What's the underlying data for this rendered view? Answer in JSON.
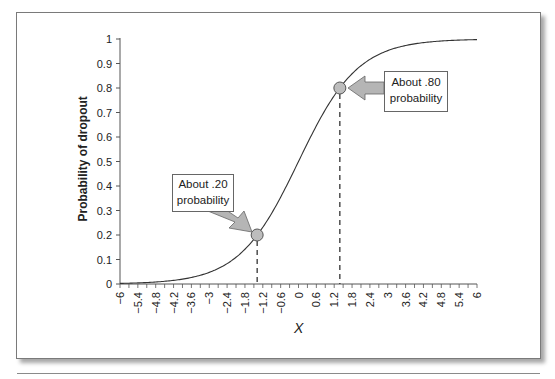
{
  "chart_data": {
    "type": "line",
    "title": "",
    "xlabel": "X",
    "ylabel": "Probability of dropout",
    "xlim": [
      -6,
      6
    ],
    "ylim": [
      0,
      1
    ],
    "grid": false,
    "legend": null,
    "x_ticks": [
      "-6",
      "-5.4",
      "-4.8",
      "-4.2",
      "-3.6",
      "-3",
      "-2.4",
      "-1.8",
      "-1.2",
      "-0.6",
      "0",
      "0.6",
      "1.2",
      "1.8",
      "2.4",
      "3",
      "3.6",
      "4.2",
      "4.8",
      "5.4",
      "6"
    ],
    "y_ticks": [
      "0",
      "0.1",
      "0.2",
      "0.3",
      "0.4",
      "0.5",
      "0.6",
      "0.7",
      "0.8",
      "0.9",
      "1"
    ],
    "series": [
      {
        "name": "Logistic curve",
        "function": "1/(1+exp(-x))",
        "x": [
          -6,
          -5.4,
          -4.8,
          -4.2,
          -3.6,
          -3,
          -2.4,
          -1.8,
          -1.2,
          -0.6,
          0,
          0.6,
          1.2,
          1.8,
          2.4,
          3,
          3.6,
          4.2,
          4.8,
          5.4,
          6
        ],
        "values": [
          0.002,
          0.004,
          0.008,
          0.015,
          0.027,
          0.047,
          0.083,
          0.142,
          0.231,
          0.354,
          0.5,
          0.646,
          0.769,
          0.858,
          0.917,
          0.953,
          0.973,
          0.985,
          0.992,
          0.996,
          0.998
        ]
      }
    ],
    "annotations": [
      {
        "text": "About .20 probability",
        "x": -1.39,
        "y": 0.2
      },
      {
        "text": "About .80 probability",
        "x": 1.39,
        "y": 0.8
      }
    ]
  },
  "labels": {
    "ylabel": "Probability of dropout",
    "xlabel": "X",
    "ann_low_line1": "About .20",
    "ann_low_line2": "probability",
    "ann_high_line1": "About .80",
    "ann_high_line2": "probability"
  },
  "colors": {
    "curve": "#333333",
    "marker_fill": "#bdbdbd",
    "arrow_fill": "#b5b5b5"
  }
}
